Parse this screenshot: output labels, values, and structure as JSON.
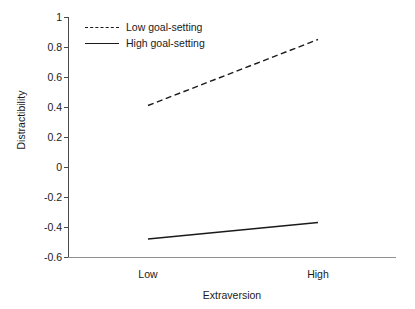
{
  "chart_data": {
    "type": "line",
    "title": "",
    "subtitle": "",
    "xlabel": "Extraversion",
    "ylabel": "Distractibility",
    "categories": [
      "Low",
      "High"
    ],
    "series": [
      {
        "name": "Low goal-setting",
        "values": [
          0.41,
          0.85
        ],
        "style": "dashed"
      },
      {
        "name": "High goal-setting",
        "values": [
          -0.48,
          -0.37
        ],
        "style": "solid"
      }
    ],
    "ylim": [
      -0.6,
      1
    ],
    "yticks": [
      "1",
      "0.8",
      "0.6",
      "0.4",
      "0.2",
      "0",
      "-0.2",
      "-0.4",
      "-0.6"
    ],
    "ytick_values": [
      1,
      0.8,
      0.6,
      0.4,
      0.2,
      0,
      -0.2,
      -0.4,
      -0.6
    ],
    "xtick_labels": [
      "Low",
      "High"
    ],
    "grid": false,
    "legend_position": "top-left",
    "line_color": "#1a1a1a",
    "axis_color": "#4a4a4a",
    "background": "#ffffff"
  },
  "legend": {
    "entries": [
      {
        "label": "Low goal-setting"
      },
      {
        "label": "High goal-setting"
      }
    ]
  },
  "axes": {
    "x_title": "Extraversion",
    "y_title": "Distractibility"
  }
}
